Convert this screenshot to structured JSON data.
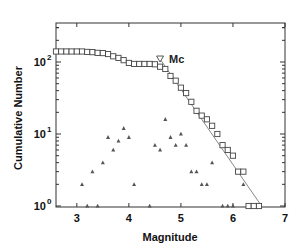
{
  "chart_data": {
    "type": "scatter",
    "title": "",
    "xlabel": "Magnitude",
    "ylabel": "Cumulative Number",
    "xlim": [
      2.6,
      7.0
    ],
    "ylim": [
      0.9,
      350
    ],
    "yscale": "log",
    "x_ticks": [
      "3",
      "4",
      "5",
      "6",
      "7"
    ],
    "y_ticks": [
      {
        "base": "10",
        "exp": "0"
      },
      {
        "base": "10",
        "exp": "1"
      },
      {
        "base": "10",
        "exp": "2"
      }
    ],
    "grid": false,
    "annotation": {
      "label": "Mc",
      "marker": "down-triangle",
      "x": 4.6,
      "y": 110
    },
    "series": [
      {
        "name": "Cumulative number",
        "marker": "square",
        "x": [
          2.6,
          2.7,
          2.8,
          2.9,
          3.0,
          3.1,
          3.2,
          3.3,
          3.4,
          3.5,
          3.6,
          3.7,
          3.8,
          3.9,
          4.0,
          4.1,
          4.2,
          4.3,
          4.4,
          4.5,
          4.6,
          4.7,
          4.8,
          4.9,
          5.0,
          5.1,
          5.2,
          5.3,
          5.4,
          5.5,
          5.6,
          5.7,
          5.8,
          5.9,
          6.0,
          6.1,
          6.2,
          6.3,
          6.4,
          6.5
        ],
        "values": [
          140,
          140,
          140,
          140,
          140,
          140,
          138,
          137,
          134,
          133,
          129,
          120,
          114,
          106,
          97,
          94,
          94,
          94,
          94,
          93,
          86,
          80,
          64,
          55,
          44,
          37,
          28,
          21,
          18,
          16,
          13,
          10,
          7,
          6,
          5,
          3,
          3,
          1,
          1,
          1
        ]
      },
      {
        "name": "Number per magnitude bin",
        "marker": "triangle",
        "x": [
          3.1,
          3.2,
          3.3,
          3.4,
          3.5,
          3.6,
          3.7,
          3.8,
          3.9,
          4.0,
          4.1,
          4.4,
          4.5,
          4.6,
          4.7,
          4.8,
          4.9,
          5.0,
          5.1,
          5.2,
          5.3,
          5.4,
          5.5,
          5.6,
          5.8,
          5.9,
          6.0,
          6.2,
          6.5
        ],
        "values": [
          2,
          1,
          3,
          1,
          4,
          9,
          6,
          8,
          12,
          9,
          2,
          1,
          7,
          6,
          16,
          9,
          7,
          10,
          7,
          3,
          3,
          2,
          2,
          4,
          1,
          1,
          1,
          2,
          1
        ]
      },
      {
        "name": "Gutenberg-Richter fit",
        "marker": "line",
        "x": [
          4.6,
          6.55
        ],
        "values": [
          110,
          1
        ]
      }
    ]
  }
}
